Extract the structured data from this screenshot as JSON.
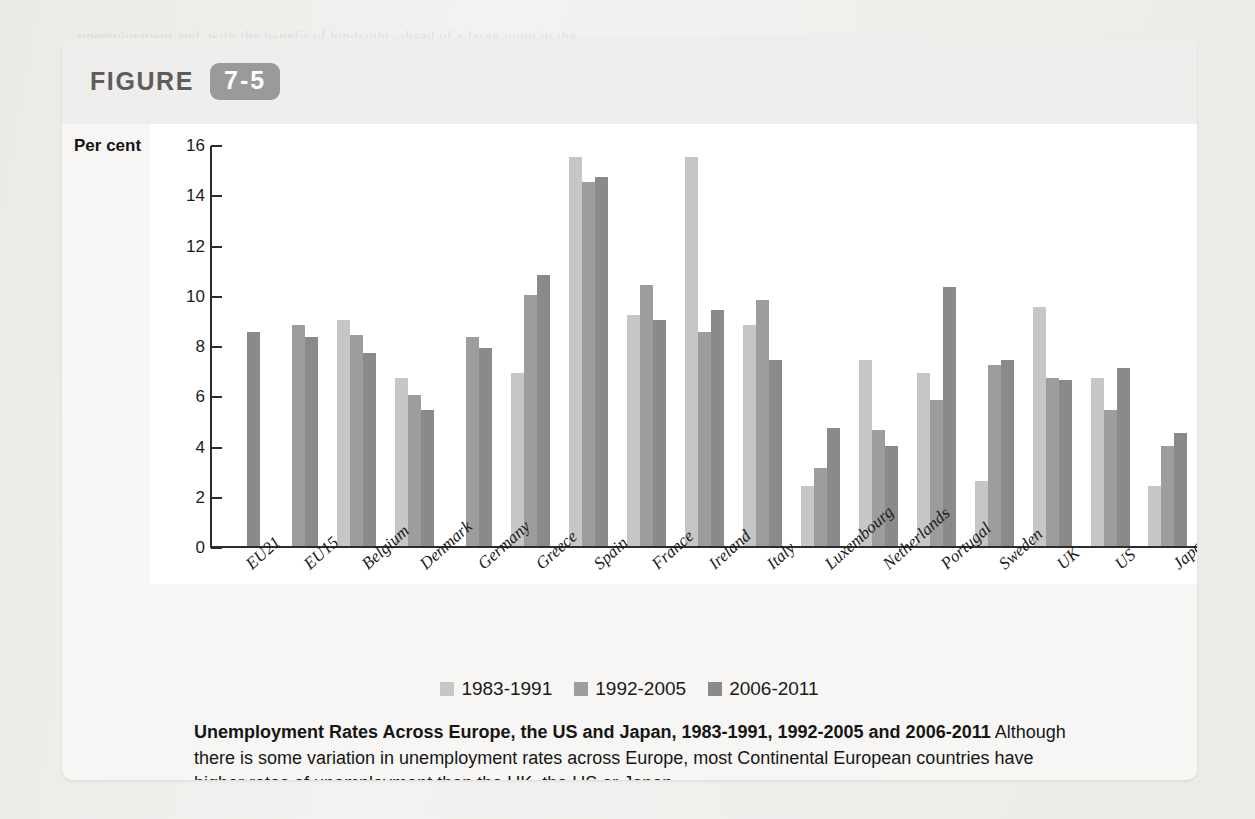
{
  "figure": {
    "word": "FIGURE",
    "number": "7-5"
  },
  "chart_data": {
    "type": "bar",
    "title": "Unemployment Rates Across Europe, the US and Japan, 1983-1991, 1992-2005 and 2006-2011",
    "xlabel": "",
    "ylabel": "Per cent",
    "ylim": [
      0,
      16
    ],
    "yticks": [
      16,
      14,
      12,
      10,
      8,
      6,
      4,
      2,
      0
    ],
    "grid": false,
    "legend_position": "bottom",
    "categories": [
      "EU21",
      "EU15",
      "Belgium",
      "Denmark",
      "Germany",
      "Greece",
      "Spain",
      "France",
      "Ireland",
      "Italy",
      "Luxembourg",
      "Netherlands",
      "Portugal",
      "Sweden",
      "UK",
      "US",
      "Japan"
    ],
    "series": [
      {
        "name": "1983-1991",
        "color": "#c6c6c6",
        "values": [
          null,
          null,
          9.0,
          6.7,
          null,
          6.9,
          15.5,
          9.2,
          15.5,
          8.8,
          2.4,
          7.4,
          6.9,
          2.6,
          9.5,
          6.7,
          2.4
        ]
      },
      {
        "name": "1992-2005",
        "color": "#9d9d9d",
        "values": [
          null,
          8.8,
          8.4,
          6.0,
          8.3,
          10.0,
          14.5,
          10.4,
          8.5,
          9.8,
          3.1,
          4.6,
          5.8,
          7.2,
          6.7,
          5.4,
          4.0
        ]
      },
      {
        "name": "2006-2011",
        "color": "#8a8a8a",
        "values": [
          8.5,
          8.3,
          7.7,
          5.4,
          7.9,
          10.8,
          14.7,
          9.0,
          9.4,
          7.4,
          4.7,
          4.0,
          10.3,
          7.4,
          6.6,
          7.1,
          4.5
        ]
      }
    ]
  },
  "caption": {
    "bold": "Unemployment Rates Across Europe, the US and Japan, 1983-1991, 1992-2005 and 2006-2011",
    "body": " Although there is some variation in unemployment rates across Europe, most Continental European countries have higher rates of unemployment than the UK, the US or Japan."
  },
  "page_bleed": [
    "unemployment and, with the benefit of hindsight, ahead of a large jump in the",
    "rate of the unemployed persons. Chapter 13 returns to this question in more",
    "detail and the pursuit across the labour market and unemployment.",
    "It is also the case that most of the increase in unemployment across the",
    "world economy is to be expected in the major economies over the first",
    "decade of the twenty-first century. The economic downturn which occurred",
    "in the aftermath of the financial crisis of 2007-2008 was the largest since",
    "the Great Depression of the 1930s. The effects of this downturn can be",
    "seen in the upturn in unemployment rates which is presented in the data",
    "shown in Figure 7-5 for the period 2006-2011.",
    "Although the rate of unemployment in the UK has been relatively low,",
    "economic and social problems associated with unemployment remain",
    "for the labour market of the twenty-first century.",
    "The effects of"
  ]
}
